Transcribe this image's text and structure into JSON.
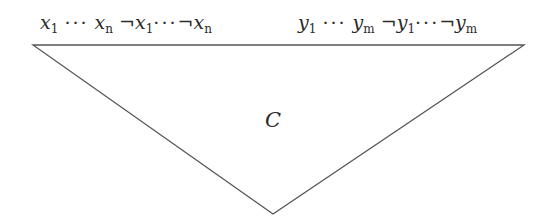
{
  "diagram": {
    "type": "circuit-triangle",
    "inputs_left": {
      "var": "x",
      "first_index": "1",
      "last_index": "n",
      "ellipsis": "···",
      "negation": "¬"
    },
    "inputs_right": {
      "var": "y",
      "first_index": "1",
      "last_index": "m",
      "ellipsis": "···",
      "negation": "¬"
    },
    "center_label": "C",
    "line_color": "#555555",
    "triangle": {
      "top_left": [
        33,
        45
      ],
      "top_right": [
        524,
        45
      ],
      "apex": [
        273,
        214
      ]
    }
  }
}
